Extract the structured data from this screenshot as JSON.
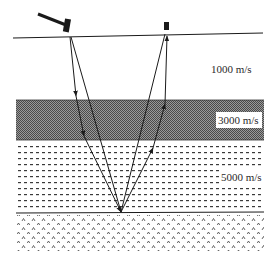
{
  "diagram": {
    "type": "seismic-reflection",
    "source": {
      "icon": "hammer-icon",
      "x": 70,
      "y": 37
    },
    "receiver": {
      "icon": "geophone-icon",
      "x": 167,
      "y": 34
    },
    "layers": [
      {
        "label": "1000 m/s",
        "top": 36,
        "bottom": 100,
        "pattern": "none"
      },
      {
        "label": "3000 m/s",
        "top": 100,
        "bottom": 140,
        "pattern": "checker-gray"
      },
      {
        "label": "5000 m/s",
        "top": 140,
        "bottom": 213,
        "pattern": "dashes"
      },
      {
        "label": "",
        "top": 213,
        "bottom": 250,
        "pattern": "carets"
      }
    ],
    "reflection_point": {
      "x": 121,
      "y": 213
    },
    "colors": {
      "ink": "#1a1a1a",
      "gray_band": "#7a7a7a",
      "text": "#2a2a2a"
    }
  }
}
